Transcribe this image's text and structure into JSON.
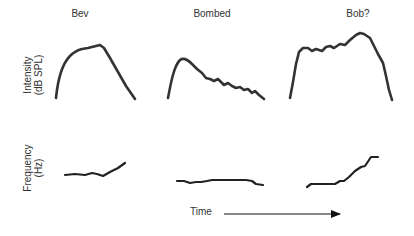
{
  "titles": [
    "Bev",
    "Bombed",
    "Bob?"
  ],
  "ylabels": {
    "intensity_line1": "Intensity",
    "intensity_line2": "(dB SPL)",
    "frequency_line1": "Frequency",
    "frequency_line2": "(Hz)"
  },
  "xlabel": "Time",
  "stroke_color": "#333333",
  "panels": [
    {
      "name": "Bev",
      "intensity_path": "M56,98 C58,78 62,64 70,56 C74,52 78,50 82,49 L88,48 L92,47 L96,46 L100,45 L104,48 L110,58 L118,72 L126,86 L135,99",
      "frequency_path": "M65,175 L75,174 L85,175 L92,173 L97,174 L103,176 L110,172 L118,168 L125,163"
    },
    {
      "name": "Bombed",
      "intensity_path": "M168,98 C171,82 174,66 180,60 C184,57 188,60 192,64 L197,69 L202,73 L206,78 L210,79 L214,81 L218,79 L221,82 L224,85 L228,83 L232,86 L236,88 L240,87 L244,90 L248,89 L252,93 L255,91 L259,95 L264,99",
      "frequency_path": "M177,181 L184,181 L190,183 L196,182 L201,182 L207,181 L212,180 L218,180 L222,180 L228,180 L234,180 L240,180 L246,180 L252,181 L256,184 L263,185"
    },
    {
      "name": "Bob?",
      "intensity_path": "M290,98 L293,82 L296,64 L299,52 L303,48 L308,48 L312,51 L316,49 L319,50 L322,51 L326,47 L330,46 L334,48 L340,44 L345,45 L350,40 L356,35 L360,33 L364,34 L370,38 L374,46 L378,54 L383,63 L386,76 L389,90 L392,100",
      "frequency_path": "M307,187 L311,184 L318,184 L327,184 L335,184 L340,181 L344,181 L349,177 L355,171 L361,167 L365,166 L369,160 L371,157 L378,157"
    }
  ],
  "arrow": {
    "x1": 224,
    "y1": 214,
    "x2": 340,
    "y2": 214
  }
}
